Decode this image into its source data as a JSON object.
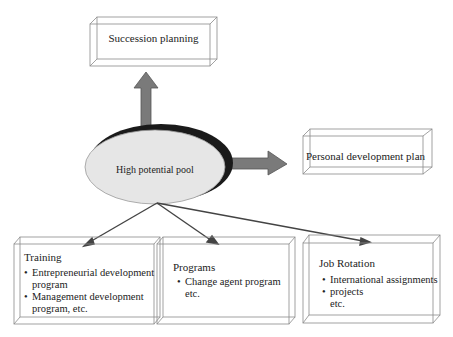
{
  "diagram": {
    "center": {
      "label": "High potential pool",
      "fill": "#e6e6e6",
      "shadow": "#1a1a1a"
    },
    "top_box": {
      "label": "Succession planning"
    },
    "right_box": {
      "label": "Personal development plan"
    },
    "bottom_boxes": [
      {
        "title": "Training",
        "lines": [
          {
            "text": "Entrepreneurial development",
            "bullet": true
          },
          {
            "text": "program",
            "bullet": false
          },
          {
            "text": "Management development",
            "bullet": true
          },
          {
            "text": "program, etc.",
            "bullet": false
          }
        ]
      },
      {
        "title": "Programs",
        "lines": [
          {
            "text": "Change agent program",
            "bullet": true
          },
          {
            "text": "etc.",
            "bullet": false
          }
        ]
      },
      {
        "title": "Job Rotation",
        "lines": [
          {
            "text": "International assignments",
            "bullet": true
          },
          {
            "text": "projects",
            "bullet": true
          },
          {
            "text": "etc.",
            "bullet": false
          }
        ]
      }
    ],
    "colors": {
      "box_edge": "#8a8a8a",
      "arrow_fill": "#7a7a7a",
      "arrow_line": "#444444"
    }
  }
}
